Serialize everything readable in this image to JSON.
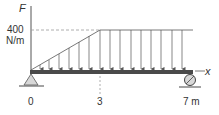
{
  "diagram": {
    "type": "beam-load-diagram",
    "axis_label": "F",
    "load_value": "400",
    "load_unit": "N/m",
    "x_axis_label": "x",
    "positions": [
      {
        "label": "0",
        "x_m": 0
      },
      {
        "label": "3",
        "x_m": 3
      },
      {
        "label": "7 m",
        "x_m": 7
      }
    ],
    "load": {
      "shape": "triangular ramp then uniform",
      "ramp_start_m": 0,
      "ramp_end_m": 3,
      "uniform_end_m": 7,
      "max_intensity": 400,
      "unit": "N/m"
    },
    "supports": [
      {
        "type": "pin",
        "position_m": 0
      },
      {
        "type": "roller",
        "position_m": 7
      }
    ],
    "colors": {
      "beam": "#4a4a4a",
      "lines": "#555555",
      "support_fill": "#d8d8d8",
      "ground": "#666666"
    }
  }
}
